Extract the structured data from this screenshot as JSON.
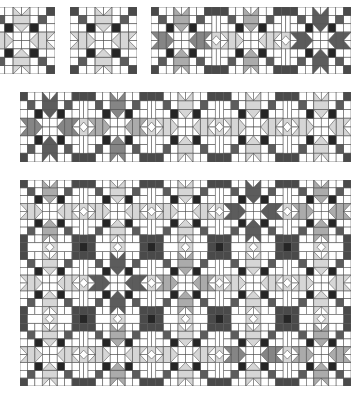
{
  "palette": {
    "white": "#ffffff",
    "line": "#555555",
    "light": "#d6d6d6",
    "mid": "#ababab",
    "middark": "#858585",
    "dark": "#5c5c5c",
    "black": "#262626",
    "corner": "#4a4a4a"
  },
  "panels": [
    {
      "name": "single-block-a",
      "x": -12,
      "y": 7,
      "w": 67,
      "h": 67,
      "cols": 1,
      "rows": 1,
      "sash": false,
      "blocks": [
        {
          "v": "light",
          "h": "light"
        }
      ]
    },
    {
      "name": "single-block-b",
      "x": 70,
      "y": 7,
      "w": 67,
      "h": 67,
      "cols": 1,
      "rows": 1,
      "sash": false,
      "blocks": [
        {
          "v": "light",
          "h": "light"
        }
      ]
    },
    {
      "name": "three-block-strip",
      "x": 151,
      "y": 7,
      "w": 200,
      "h": 67,
      "cols": 3,
      "rows": 1,
      "sash": true,
      "blocks": [
        {
          "v": "mid",
          "h": "middark"
        },
        {
          "v": "mid",
          "h": "light"
        },
        {
          "v": "dark",
          "h": "dark"
        }
      ]
    },
    {
      "name": "five-block-row",
      "x": 20,
      "y": 92,
      "w": 331,
      "h": 70,
      "cols": 5,
      "rows": 1,
      "sash": true,
      "blocks": [
        {
          "v": "dark",
          "h": "middark"
        },
        {
          "v": "middark",
          "h": "mid"
        },
        {
          "v": "light",
          "h": "light"
        },
        {
          "v": "light",
          "h": "light"
        },
        {
          "v": "light",
          "h": "light"
        }
      ]
    },
    {
      "name": "quilt-layout",
      "x": 20,
      "y": 180,
      "w": 331,
      "h": 206,
      "cols": 5,
      "rows": 3,
      "sash": true,
      "blocks": [
        {
          "v": "mid",
          "h": "light"
        },
        {
          "v": "light",
          "h": "light"
        },
        {
          "v": "light",
          "h": "light"
        },
        {
          "v": "dark",
          "h": "dark"
        },
        {
          "v": "mid",
          "h": "mid"
        },
        {
          "v": "light",
          "h": "light"
        },
        {
          "v": "dark",
          "h": "dark"
        },
        {
          "v": "mid",
          "h": "mid"
        },
        {
          "v": "light",
          "h": "light"
        },
        {
          "v": "light",
          "h": "light"
        },
        {
          "v": "light",
          "h": "light"
        },
        {
          "v": "mid",
          "h": "light"
        },
        {
          "v": "light",
          "h": "light"
        },
        {
          "v": "light",
          "h": "middark"
        },
        {
          "v": "mid",
          "h": "mid"
        }
      ]
    }
  ]
}
